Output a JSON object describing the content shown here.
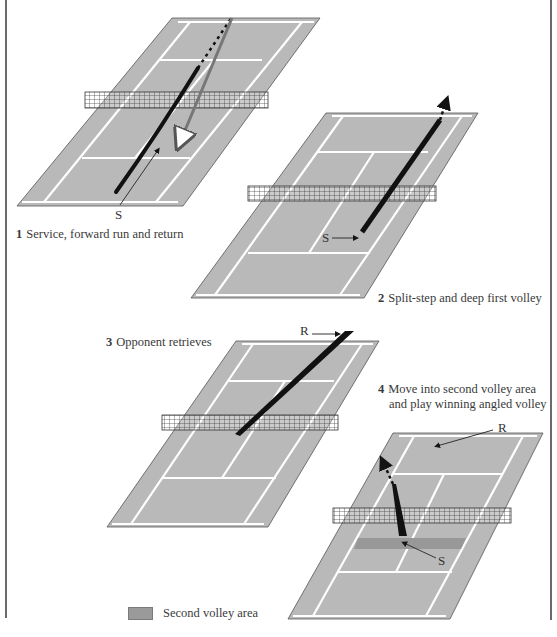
{
  "figure": {
    "colors": {
      "court": "#b9b9b9",
      "court_line": "#ffffff",
      "outline": "#555555",
      "path": "#141414",
      "volley_area": "#989898",
      "frame": "#6a6a6a"
    }
  },
  "panels": [
    {
      "id": 1,
      "number": "1",
      "caption": "Service, forward run and return",
      "court": {
        "tl": [
          172,
          18
        ],
        "tr": [
          320,
          18
        ],
        "br": [
          183,
          206
        ],
        "bl": [
          17,
          206
        ]
      },
      "net": {
        "x": 85,
        "y": 92,
        "w": 183,
        "h": 16
      },
      "labels": [
        {
          "text": "S",
          "x": 117,
          "y": 210
        }
      ]
    },
    {
      "id": 2,
      "number": "2",
      "caption": "Split-step and deep first volley",
      "court": {
        "tl": [
          326,
          113
        ],
        "tr": [
          478,
          113
        ],
        "br": [
          364,
          298
        ],
        "bl": [
          191,
          298
        ]
      },
      "net": {
        "x": 248,
        "y": 186,
        "w": 188,
        "h": 15
      },
      "labels": [
        {
          "text": "S",
          "x": 322,
          "y": 232
        }
      ]
    },
    {
      "id": 3,
      "number": "3",
      "caption": "Opponent retrieves",
      "court": {
        "tl": [
          236,
          341
        ],
        "tr": [
          379,
          341
        ],
        "br": [
          268,
          527
        ],
        "bl": [
          107,
          527
        ]
      },
      "net": {
        "x": 162,
        "y": 415,
        "w": 176,
        "h": 15
      },
      "labels": [
        {
          "text": "R",
          "x": 300,
          "y": 326
        }
      ]
    },
    {
      "id": 4,
      "number": "4",
      "caption_lines": [
        "Move into second volley area",
        "and play winning angled volley"
      ],
      "court": {
        "tl": [
          393,
          433
        ],
        "tr": [
          543,
          433
        ],
        "br": [
          450,
          619
        ],
        "bl": [
          288,
          619
        ]
      },
      "net": {
        "x": 333,
        "y": 508,
        "w": 178,
        "h": 15
      },
      "volley_area": {
        "note": "Second volley area band"
      },
      "labels": [
        {
          "text": "R",
          "x": 498,
          "y": 420
        },
        {
          "text": "S",
          "x": 438,
          "y": 555
        }
      ]
    }
  ],
  "legend": {
    "items": [
      {
        "label": "Second volley area",
        "color": "#9a9a9a"
      }
    ]
  }
}
